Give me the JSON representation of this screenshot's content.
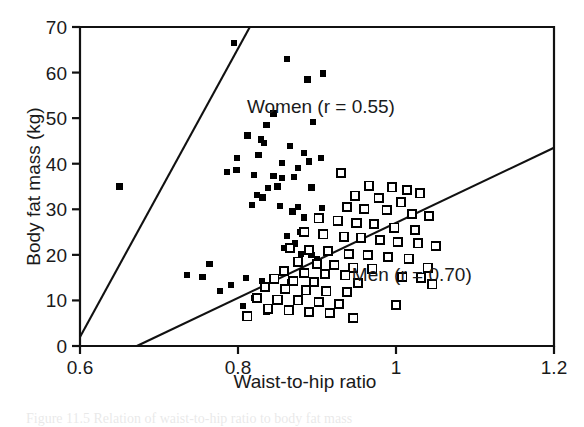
{
  "figure": {
    "caption": "Figure 11.5  Relation of waist-to-hip ratio to body fat mass"
  },
  "chart_data": {
    "type": "scatter",
    "title": "",
    "xlabel": "Waist-to-hip ratio",
    "ylabel": "Body fat mass (kg)",
    "xlim": [
      0.6,
      1.2
    ],
    "ylim": [
      0,
      70
    ],
    "xticks": [
      0.6,
      0.8,
      1,
      1.2
    ],
    "xtick_labels": [
      "0.6",
      "0.8",
      "1",
      "1.2"
    ],
    "yticks": [
      0,
      10,
      20,
      30,
      40,
      50,
      60,
      70
    ],
    "ytick_labels": [
      "0",
      "10",
      "20",
      "30",
      "40",
      "50",
      "60",
      "70"
    ],
    "grid": false,
    "legend_position": "in-plot-annotations",
    "series": [
      {
        "name": "Women",
        "marker": "filled-square",
        "color": "#000000",
        "annotation": "Women (r = 0.55)",
        "r": 0.55,
        "annotation_x": 0.905,
        "annotation_y": 52.5,
        "fit_line": {
          "x0": 0.6,
          "y0": 2.0,
          "x1": 0.815,
          "y1": 70.0
        },
        "points": [
          [
            0.795,
            66.5
          ],
          [
            0.862,
            63.0
          ],
          [
            0.888,
            58.5
          ],
          [
            0.908,
            59.8
          ],
          [
            0.845,
            51.0
          ],
          [
            0.836,
            48.5
          ],
          [
            0.895,
            49.2
          ],
          [
            0.812,
            46.2
          ],
          [
            0.829,
            45.3
          ],
          [
            0.833,
            44.5
          ],
          [
            0.866,
            43.8
          ],
          [
            0.884,
            42.3
          ],
          [
            0.89,
            40.5
          ],
          [
            0.799,
            41.3
          ],
          [
            0.826,
            42.0
          ],
          [
            0.856,
            40.2
          ],
          [
            0.905,
            41.2
          ],
          [
            0.786,
            38.2
          ],
          [
            0.798,
            38.6
          ],
          [
            0.82,
            37.5
          ],
          [
            0.845,
            37.3
          ],
          [
            0.856,
            36.8
          ],
          [
            0.871,
            37.1
          ],
          [
            0.876,
            39.0
          ],
          [
            0.65,
            35.0
          ],
          [
            0.838,
            34.6
          ],
          [
            0.85,
            35.0
          ],
          [
            0.893,
            34.8
          ],
          [
            0.824,
            33.2
          ],
          [
            0.831,
            32.6
          ],
          [
            0.818,
            31.0
          ],
          [
            0.853,
            30.8
          ],
          [
            0.876,
            30.5
          ],
          [
            0.906,
            30.2
          ],
          [
            0.869,
            29.5
          ],
          [
            0.884,
            28.2
          ],
          [
            0.9,
            27.8
          ],
          [
            0.879,
            25.0
          ],
          [
            0.862,
            24.2
          ],
          [
            0.872,
            22.5
          ],
          [
            0.858,
            21.5
          ],
          [
            0.88,
            20.2
          ],
          [
            0.893,
            20.0
          ],
          [
            0.9,
            19.0
          ],
          [
            0.764,
            18.0
          ],
          [
            0.735,
            15.5
          ],
          [
            0.755,
            15.2
          ],
          [
            0.81,
            15.0
          ],
          [
            0.83,
            14.3
          ],
          [
            0.848,
            14.2
          ],
          [
            0.866,
            14.0
          ],
          [
            0.791,
            13.3
          ],
          [
            0.777,
            12.0
          ],
          [
            0.82,
            10.6
          ],
          [
            0.806,
            8.7
          ],
          [
            0.836,
            7.5
          ]
        ]
      },
      {
        "name": "Men",
        "marker": "open-square",
        "color": "#000000",
        "annotation": "Men (r = 0.70)",
        "r": 0.7,
        "annotation_x": 1.02,
        "annotation_y": 15.5,
        "fit_line": {
          "x0": 0.672,
          "y0": 0.0,
          "x1": 1.2,
          "y1": 43.5
        },
        "points": [
          [
            0.93,
            38.0
          ],
          [
            0.966,
            35.2
          ],
          [
            0.995,
            34.8
          ],
          [
            1.014,
            34.2
          ],
          [
            1.03,
            33.5
          ],
          [
            0.948,
            33.0
          ],
          [
            0.978,
            32.5
          ],
          [
            1.006,
            31.5
          ],
          [
            0.938,
            30.5
          ],
          [
            0.96,
            30.0
          ],
          [
            0.988,
            29.8
          ],
          [
            1.02,
            29.0
          ],
          [
            1.042,
            28.5
          ],
          [
            0.902,
            28.0
          ],
          [
            0.926,
            27.5
          ],
          [
            0.95,
            27.0
          ],
          [
            0.972,
            26.8
          ],
          [
            0.998,
            26.0
          ],
          [
            1.024,
            25.5
          ],
          [
            0.884,
            25.0
          ],
          [
            0.908,
            24.5
          ],
          [
            0.934,
            24.0
          ],
          [
            0.956,
            23.8
          ],
          [
            0.98,
            23.2
          ],
          [
            1.002,
            22.8
          ],
          [
            1.028,
            22.5
          ],
          [
            1.05,
            22.0
          ],
          [
            0.866,
            21.5
          ],
          [
            0.89,
            21.0
          ],
          [
            0.914,
            20.8
          ],
          [
            0.94,
            20.2
          ],
          [
            0.964,
            20.0
          ],
          [
            0.99,
            19.5
          ],
          [
            1.016,
            19.2
          ],
          [
            0.876,
            18.5
          ],
          [
            0.9,
            18.0
          ],
          [
            0.922,
            17.8
          ],
          [
            0.946,
            17.2
          ],
          [
            0.97,
            17.0
          ],
          [
            1.04,
            17.2
          ],
          [
            0.858,
            16.5
          ],
          [
            0.884,
            16.0
          ],
          [
            0.91,
            15.8
          ],
          [
            0.936,
            15.5
          ],
          [
            1.008,
            15.2
          ],
          [
            1.032,
            15.0
          ],
          [
            0.846,
            14.8
          ],
          [
            0.87,
            14.2
          ],
          [
            0.896,
            14.0
          ],
          [
            0.952,
            13.8
          ],
          [
            1.046,
            13.5
          ],
          [
            0.834,
            13.0
          ],
          [
            0.86,
            12.5
          ],
          [
            0.886,
            12.2
          ],
          [
            0.912,
            12.0
          ],
          [
            0.938,
            11.8
          ],
          [
            0.824,
            10.5
          ],
          [
            0.85,
            10.2
          ],
          [
            0.876,
            10.0
          ],
          [
            0.902,
            9.6
          ],
          [
            0.928,
            9.2
          ],
          [
            1.0,
            9.0
          ],
          [
            0.838,
            8.2
          ],
          [
            0.864,
            7.8
          ],
          [
            0.89,
            7.5
          ],
          [
            0.916,
            7.2
          ],
          [
            0.812,
            6.5
          ],
          [
            0.946,
            6.2
          ]
        ]
      }
    ]
  }
}
